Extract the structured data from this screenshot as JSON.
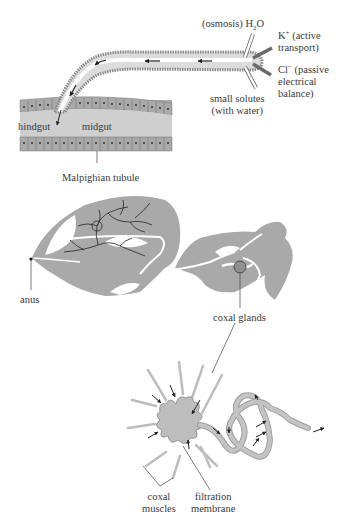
{
  "diagram": {
    "colors": {
      "tissue_fill": "#a9a9a9",
      "tissue_light": "#c8c8c8",
      "outline": "#6b6b6b",
      "arrow": "#222222",
      "background": "#ffffff"
    },
    "top_panel": {
      "labels": {
        "osmosis": "(osmosis) H",
        "osmosis_sub": "2",
        "osmosis_tail": "O",
        "k_ion": "K",
        "k_sup": "+",
        "k_desc1": " (active",
        "k_desc2": "transport)",
        "cl_ion": "Cl",
        "cl_sup": "−",
        "cl_desc1": " (passive",
        "cl_desc2": "electrical",
        "cl_desc3": "balance)",
        "solutes1": "small solutes",
        "solutes2": "(with water)",
        "hindgut": "hindgut",
        "midgut": "midgut",
        "malpighian": "Malpighian tubule"
      }
    },
    "middle_panel": {
      "labels": {
        "anus": "anus",
        "coxal_glands": "coxal glands"
      }
    },
    "bottom_panel": {
      "labels": {
        "coxal_muscles1": "coxal",
        "coxal_muscles2": "muscles",
        "filtration1": "filtration",
        "filtration2": "membrane"
      }
    }
  }
}
